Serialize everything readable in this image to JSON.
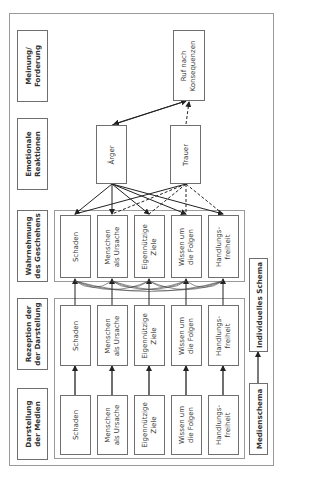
{
  "diagram": {
    "row_labels": [
      {
        "id": "meinung",
        "text": "Meinung/\nForderung"
      },
      {
        "id": "emotion",
        "text": "Emotionale\nReaktionen"
      },
      {
        "id": "wahrnehmung",
        "text": "Wahrnehmung\ndes Geschehens"
      },
      {
        "id": "rezeption",
        "text": "Rezeption der\nder Darstellung"
      },
      {
        "id": "darstellung",
        "text": "Darstellung\nder Medien"
      }
    ],
    "factors": [
      {
        "id": "schaden",
        "text": "Schaden"
      },
      {
        "id": "menschen",
        "text": "Menschen\nals Ursache"
      },
      {
        "id": "ziele",
        "text": "Eigennützige\nZiele"
      },
      {
        "id": "wissen",
        "text": "Wissen um\ndie Folgen"
      },
      {
        "id": "freiheit",
        "text": "Handlungs-\nfreiheit"
      }
    ],
    "emotions": [
      {
        "id": "aerger",
        "text": "Ärger"
      },
      {
        "id": "trauer",
        "text": "Trauer"
      }
    ],
    "outcome": {
      "text": "Ruf nach\nKonsequenzen"
    },
    "schemas": {
      "individual": "Individuelles Schema",
      "media": "Medienschema"
    },
    "edges": {
      "aerger_to_outcome": "solid",
      "trauer_to_outcome": "dashed",
      "factors_to_aerger": "solid",
      "factors_to_trauer": "dashed (Schaden, Menschen solid)",
      "rezeption_to_wahrnehmung": "solid with curved cross-links",
      "darstellung_to_rezeption": "solid",
      "medienschema_to_individuelles_schema": "solid"
    }
  }
}
